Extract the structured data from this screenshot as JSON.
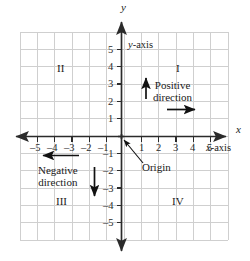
{
  "figure": {
    "type": "cartesian-coordinate-plane",
    "grid": {
      "x_min": -6,
      "x_max": 6,
      "y_min": -6,
      "y_max": 6,
      "cell_px": 17.33,
      "grid_color": "#cfcfcf",
      "axis_color": "#2b2b2b"
    },
    "axes": {
      "x_name": "x",
      "y_name": "y",
      "x_axis_label": "x-axis",
      "y_axis_label": "y-axis",
      "x_axis_label_italic_prefix": "x",
      "x_axis_label_rest": "-axis",
      "y_axis_label_italic_prefix": "y",
      "y_axis_label_rest": "-axis"
    },
    "x_ticks_negative": [
      "–5",
      "–4",
      "–3",
      "–2",
      "–1"
    ],
    "x_ticks_positive": [
      "1",
      "2",
      "3",
      "4",
      "5"
    ],
    "y_ticks_positive": [
      "5",
      "4",
      "3",
      "2",
      "1"
    ],
    "y_ticks_negative": [
      "–1",
      "–2",
      "–3",
      "–4",
      "–5"
    ],
    "quadrants": [
      {
        "id": "I",
        "label": "I"
      },
      {
        "id": "II",
        "label": "II"
      },
      {
        "id": "III",
        "label": "III"
      },
      {
        "id": "IV",
        "label": "IV"
      }
    ],
    "annotations": {
      "origin": "Origin",
      "positive_direction_line1": "Positive",
      "positive_direction_line2": "direction",
      "negative_direction_line1": "Negative",
      "negative_direction_line2": "direction"
    }
  }
}
